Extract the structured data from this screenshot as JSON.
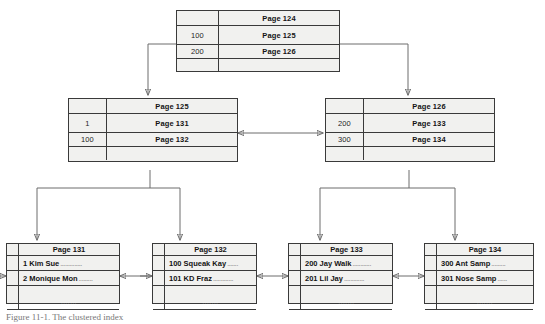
{
  "figure": {
    "caption": "Figure 11-1. The clustered index"
  },
  "nodes": {
    "root": {
      "title": "Page 124",
      "rows": [
        {
          "key": "100",
          "value": "Page 125"
        },
        {
          "key": "200",
          "value": "Page 126"
        }
      ],
      "tail": ""
    },
    "index_left": {
      "title": "Page 125",
      "rows": [
        {
          "key": "1",
          "value": "Page 131"
        },
        {
          "key": "100",
          "value": "Page 132"
        }
      ],
      "tail": ""
    },
    "index_right": {
      "title": "Page 126",
      "rows": [
        {
          "key": "200",
          "value": "Page 133"
        },
        {
          "key": "300",
          "value": "Page 134"
        }
      ],
      "tail": ""
    },
    "leaf_131": {
      "title": "Page 131",
      "records": [
        {
          "text": "1 Kim Sue",
          "dots": ".............."
        },
        {
          "text": "2 Monique Mon",
          "dots": "........."
        }
      ],
      "tail": "......."
    },
    "leaf_132": {
      "title": "Page 132",
      "records": [
        {
          "text": "100 Squeak Kay",
          "dots": "......."
        },
        {
          "text": "101 KD Fraz",
          "dots": "............."
        }
      ],
      "tail": "......."
    },
    "leaf_133": {
      "title": "Page 133",
      "records": [
        {
          "text": "200 Jay Walk",
          "dots": "............"
        },
        {
          "text": "201 Lil Jay",
          "dots": "............."
        }
      ],
      "tail": "......."
    },
    "leaf_134": {
      "title": "Page 134",
      "records": [
        {
          "text": "300 Ant Samp",
          "dots": "........."
        },
        {
          "text": "301 Nose Samp",
          "dots": "......"
        }
      ],
      "tail": "......."
    }
  },
  "colors": {
    "node_fill": "#f1f1ef",
    "node_border": "#3a3a3a",
    "connector": "#6d6d6d",
    "page_background": "#ffffff"
  }
}
